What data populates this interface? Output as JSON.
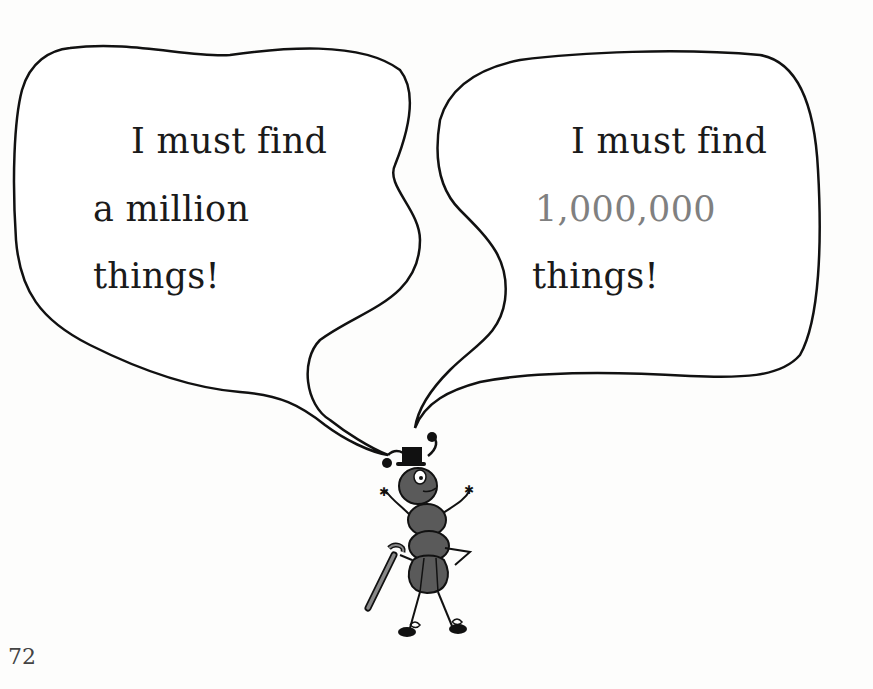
{
  "page": {
    "page_number": "72",
    "bubbles": [
      {
        "lines": [
          "I must find",
          "a million",
          "things!"
        ]
      },
      {
        "lines": [
          "I must find",
          "1,000,000",
          "things!"
        ]
      }
    ],
    "colors": {
      "text": "#1a1a1a",
      "numeral": "#808080",
      "outline": "#111111",
      "ant_body": "#5a5a5a"
    },
    "illustration": "ant-character-with-top-hat-and-cane"
  }
}
